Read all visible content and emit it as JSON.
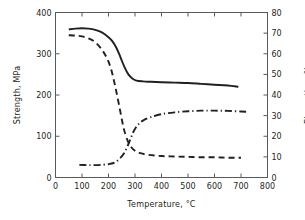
{
  "chart_data": {
    "type": "line",
    "title": "",
    "xlabel": "Temperature,  °C",
    "ylabel": "Strength, MPa",
    "ylabel_right": "Elongation, %",
    "xlim": [
      0,
      800
    ],
    "ylim": [
      0,
      400
    ],
    "ylim_right": [
      0,
      80
    ],
    "xticks": [
      0,
      100,
      200,
      300,
      400,
      500,
      600,
      700,
      800
    ],
    "xticklabels": [
      "0",
      "100",
      "200",
      "300",
      "400",
      "500",
      "600",
      "700",
      "800"
    ],
    "yticks": [
      0,
      100,
      200,
      300,
      400
    ],
    "yticklabels": [
      "0",
      "100",
      "200",
      "300",
      "400"
    ],
    "yticks_right": [
      0,
      10,
      20,
      30,
      40,
      50,
      60,
      70,
      80
    ],
    "yticklabels_right": [
      "0",
      "10",
      "20",
      "30",
      "40",
      "50",
      "60",
      "70",
      "80"
    ],
    "grid": false,
    "legend": "none",
    "line_color": "#231f20",
    "axis_color": "#58595b",
    "series": [
      {
        "name": "Tensile strength",
        "axis": "left",
        "style": "solid",
        "units": "MPa",
        "x": [
          50,
          75,
          100,
          125,
          150,
          175,
          200,
          215,
          230,
          245,
          260,
          275,
          290,
          305,
          330,
          360,
          400,
          450,
          500,
          550,
          600,
          650,
          690
        ],
        "y": [
          359,
          361,
          362,
          361,
          358,
          352,
          340,
          330,
          314,
          292,
          268,
          250,
          240,
          235,
          233,
          232,
          231,
          230,
          229,
          227,
          225,
          223,
          220
        ]
      },
      {
        "name": "Yield strength",
        "axis": "left",
        "style": "dashed",
        "units": "MPa",
        "x": [
          50,
          75,
          100,
          125,
          150,
          175,
          195,
          210,
          225,
          240,
          255,
          265,
          275,
          285,
          300,
          320,
          350,
          400,
          450,
          500,
          550,
          600,
          650,
          700
        ],
        "y": [
          345,
          344,
          342,
          337,
          328,
          310,
          288,
          262,
          222,
          175,
          126,
          102,
          85,
          74,
          65,
          59,
          55,
          52,
          51,
          50,
          49,
          49,
          48,
          48
        ]
      },
      {
        "name": "Elongation",
        "axis": "right",
        "style": "dashdot",
        "units": "%",
        "x": [
          90,
          120,
          150,
          180,
          205,
          225,
          245,
          258,
          270,
          282,
          295,
          310,
          330,
          360,
          400,
          450,
          500,
          550,
          600,
          650,
          700,
          730
        ],
        "y": [
          6.1,
          6.0,
          6.0,
          6.2,
          6.6,
          7.4,
          9.5,
          11.6,
          14.6,
          18.4,
          22.4,
          25.4,
          27.6,
          29.3,
          30.7,
          31.6,
          32.1,
          32.4,
          32.4,
          32.3,
          32.0,
          31.8
        ]
      }
    ]
  }
}
